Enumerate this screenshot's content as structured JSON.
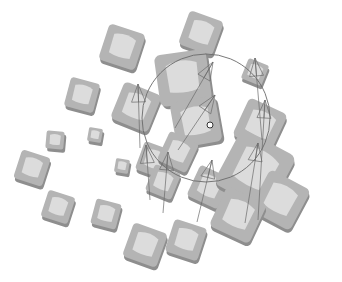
{
  "scene": {
    "width": 342,
    "height": 282,
    "background": "#ffffff",
    "colors": {
      "tile_dark": "#8e8e8e",
      "tile_mid": "#b4b4b4",
      "tile_light": "#dcdcdc",
      "tile_edge": "#9c9c9c",
      "gizmo_line": "#6a6a6a"
    },
    "tiles": [
      {
        "x": 201,
        "y": 33,
        "s": 36,
        "r": 20
      },
      {
        "x": 122,
        "y": 47,
        "s": 38,
        "r": 18
      },
      {
        "x": 82,
        "y": 95,
        "s": 30,
        "r": 15
      },
      {
        "x": 136,
        "y": 107,
        "s": 40,
        "r": 22
      },
      {
        "x": 183,
        "y": 78,
        "s": 52,
        "r": -8
      },
      {
        "x": 196,
        "y": 122,
        "s": 46,
        "r": -10
      },
      {
        "x": 255,
        "y": 72,
        "s": 22,
        "r": 22
      },
      {
        "x": 260,
        "y": 125,
        "s": 42,
        "r": 25
      },
      {
        "x": 55,
        "y": 140,
        "s": 18,
        "r": 5
      },
      {
        "x": 95,
        "y": 135,
        "s": 14,
        "r": 10
      },
      {
        "x": 32,
        "y": 168,
        "s": 30,
        "r": 18
      },
      {
        "x": 122,
        "y": 166,
        "s": 14,
        "r": 10
      },
      {
        "x": 154,
        "y": 160,
        "s": 30,
        "r": 20
      },
      {
        "x": 178,
        "y": 152,
        "s": 32,
        "r": 25
      },
      {
        "x": 163,
        "y": 182,
        "s": 28,
        "r": 22
      },
      {
        "x": 209,
        "y": 187,
        "s": 34,
        "r": 25
      },
      {
        "x": 255,
        "y": 170,
        "s": 62,
        "r": 28
      },
      {
        "x": 280,
        "y": 200,
        "s": 46,
        "r": 28
      },
      {
        "x": 238,
        "y": 215,
        "s": 44,
        "r": 25
      },
      {
        "x": 58,
        "y": 207,
        "s": 28,
        "r": 18
      },
      {
        "x": 106,
        "y": 214,
        "s": 26,
        "r": 15
      },
      {
        "x": 145,
        "y": 245,
        "s": 36,
        "r": 20
      },
      {
        "x": 186,
        "y": 240,
        "s": 34,
        "r": 18
      }
    ],
    "cones": [
      {
        "x1": 140,
        "y1": 148,
        "x2": 138,
        "y2": 84
      },
      {
        "x1": 175,
        "y1": 128,
        "x2": 213,
        "y2": 62
      },
      {
        "x1": 178,
        "y1": 150,
        "x2": 215,
        "y2": 95
      },
      {
        "x1": 262,
        "y1": 140,
        "x2": 255,
        "y2": 58
      },
      {
        "x1": 258,
        "y1": 220,
        "x2": 265,
        "y2": 100
      },
      {
        "x1": 150,
        "y1": 200,
        "x2": 146,
        "y2": 145
      },
      {
        "x1": 163,
        "y1": 213,
        "x2": 168,
        "y2": 152
      },
      {
        "x1": 197,
        "y1": 222,
        "x2": 212,
        "y2": 160
      },
      {
        "x1": 245,
        "y1": 223,
        "x2": 258,
        "y2": 143
      }
    ],
    "gizmo_circle": {
      "cx": 206,
      "cy": 118,
      "r": 64
    },
    "cursor": {
      "x": 210,
      "y": 125
    }
  }
}
